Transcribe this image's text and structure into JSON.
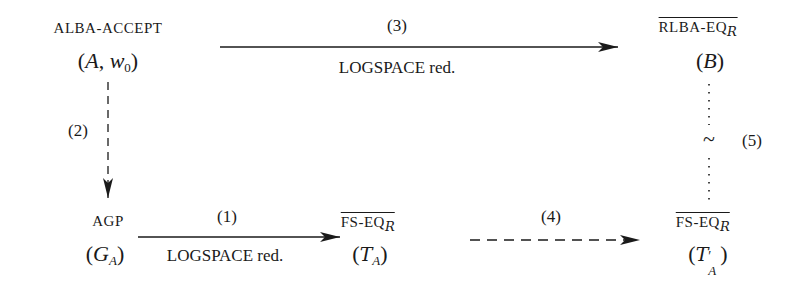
{
  "nodes": {
    "alba": {
      "problem": "ALBA-ACCEPT",
      "instance_pre": "(",
      "instance_var": "A",
      "instance_sep": ", ",
      "instance_var2": "w",
      "instance_sub2": "0",
      "instance_post": ")"
    },
    "rlba": {
      "problem": "RLBA-EQ",
      "problem_sub": "R",
      "instance_pre": "(",
      "instance_var": "B",
      "instance_post": ")"
    },
    "agp": {
      "problem": "AGP",
      "instance_pre": "(",
      "instance_var": "G",
      "instance_sub": "A",
      "instance_post": ")"
    },
    "fs1": {
      "problem": "FS-EQ",
      "problem_sub": "R",
      "instance_pre": "(",
      "instance_var": "T",
      "instance_sub": "A",
      "instance_post": ")"
    },
    "fs2": {
      "problem": "FS-EQ",
      "problem_sub": "R",
      "instance_pre": "(",
      "instance_var": "T",
      "instance_prime": "′",
      "instance_sub": "A",
      "instance_post": ")"
    }
  },
  "edges": {
    "e3": {
      "number": "(3)",
      "label": "LOGSPACE red.",
      "style": "solid"
    },
    "e2": {
      "number": "(2)",
      "style": "dashed"
    },
    "e1": {
      "number": "(1)",
      "label": "LOGSPACE red.",
      "style": "solid"
    },
    "e4": {
      "number": "(4)",
      "style": "dashed"
    },
    "e5": {
      "number": "(5)",
      "symbol": "~",
      "style": "dotted"
    }
  }
}
